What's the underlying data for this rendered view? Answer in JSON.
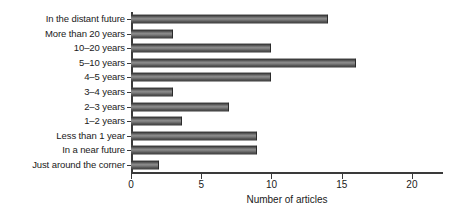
{
  "chart_data": {
    "type": "bar",
    "orientation": "horizontal",
    "title": "",
    "xlabel": "Number of articles",
    "ylabel": "",
    "categories": [
      "In the distant future",
      "More than 20 years",
      "10–20 years",
      "5–10 years",
      "4–5 years",
      "3–4 years",
      "2–3 years",
      "1–2 years",
      "Less than 1 year",
      "In a near future",
      "Just around the corner"
    ],
    "values": [
      14,
      3,
      10,
      16,
      10,
      3,
      7,
      3.6,
      9,
      9,
      2
    ],
    "xlim": [
      0,
      21.5
    ],
    "xticks": [
      0,
      5,
      10,
      15,
      20
    ],
    "xticklabels": [
      "0",
      "5",
      "10",
      "15",
      "20"
    ],
    "grid": false,
    "legend": null,
    "bar_color": "#6e6e6e",
    "axis_color": "#3a3a3a",
    "background": "#ffffff"
  }
}
